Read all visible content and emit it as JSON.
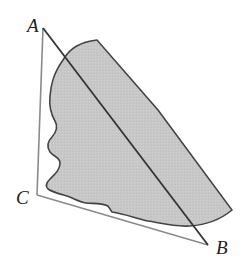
{
  "diagram": {
    "type": "geometry",
    "vertices": [
      {
        "id": "A",
        "label": "A",
        "x": 43,
        "y": 28,
        "label_x": 27,
        "label_y": 32
      },
      {
        "id": "B",
        "label": "B",
        "x": 208,
        "y": 245,
        "label_x": 216,
        "label_y": 254
      },
      {
        "id": "C",
        "label": "C",
        "x": 37,
        "y": 195,
        "label_x": 16,
        "label_y": 204
      }
    ],
    "edges": [
      {
        "from": "A",
        "to": "C"
      },
      {
        "from": "C",
        "to": "B"
      },
      {
        "from": "A",
        "to": "B"
      }
    ],
    "colors": {
      "triangle_stroke": "#8a8a8a",
      "diagonal_stroke": "#333333",
      "region_outline": "#444444",
      "region_fill": "#c8c8c8"
    },
    "shaded_region": "irregular lake-shaped region bounded by wavy left shoreline, crossed by segment AB"
  }
}
